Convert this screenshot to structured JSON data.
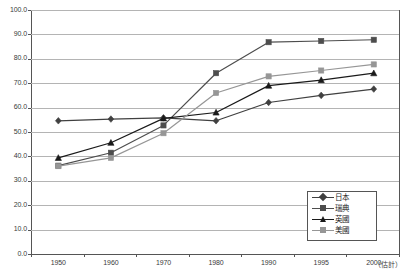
{
  "chart_data": {
    "type": "line",
    "title": "",
    "subtitle": "",
    "xlabel": "",
    "ylabel": "",
    "x": [
      "1950",
      "1960",
      "1970",
      "1980",
      "1990",
      "1995",
      "2000"
    ],
    "x_axis_note": "（估計）",
    "xtick_labels": [
      "1950",
      "1960",
      "1970",
      "1980",
      "1990",
      "1995",
      "2000"
    ],
    "ytick_labels": [
      "0.0",
      "10.0",
      "20.0",
      "30.0",
      "40.0",
      "50.0",
      "60.0",
      "70.0",
      "80.0",
      "90.0",
      "100.0"
    ],
    "ytick_values": [
      0,
      10,
      20,
      30,
      40,
      50,
      60,
      70,
      80,
      90,
      100
    ],
    "ylim": [
      0,
      100
    ],
    "grid": "horizontal",
    "legend_position": "bottom-right",
    "series": [
      {
        "name": "日本",
        "color": "#404040",
        "marker": "diamond",
        "values": [
          54.6,
          55.3,
          55.8,
          54.6,
          62.1,
          65.0,
          67.6
        ]
      },
      {
        "name": "瑞典",
        "color": "#4d4d4d",
        "marker": "square",
        "values": [
          36.2,
          41.5,
          52.7,
          74.1,
          86.8,
          87.3,
          87.8
        ]
      },
      {
        "name": "英國",
        "color": "#1a1a1a",
        "marker": "triangle",
        "values": [
          39.4,
          45.6,
          55.6,
          58.0,
          69.0,
          71.3,
          74.1
        ]
      },
      {
        "name": "美國",
        "color": "#969696",
        "marker": "square",
        "values": [
          36.0,
          39.4,
          49.5,
          66.0,
          72.8,
          75.2,
          77.7
        ]
      }
    ]
  },
  "legend": {
    "entries": [
      "日本",
      "瑞典",
      "英國",
      "美國"
    ]
  }
}
